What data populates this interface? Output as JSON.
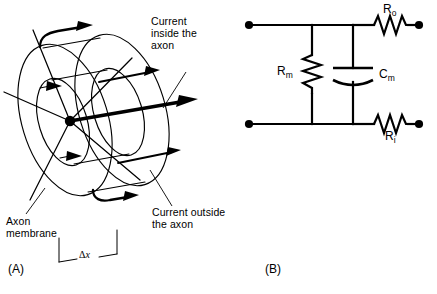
{
  "figure": {
    "background_color": "#ffffff",
    "stroke_color": "#000000",
    "width": 437,
    "height": 294
  },
  "panel_a": {
    "letter": "(A)",
    "description": "Cylindrical axon segment drawn as concentric ellipses with current arrows",
    "labels": {
      "current_inside": [
        "Current",
        "inside the",
        "axon"
      ],
      "current_outside": [
        "Current outside",
        "the axon"
      ],
      "axon_membrane": [
        "Axon",
        "membrane"
      ]
    },
    "dimension": {
      "delta": "Δ",
      "variable": "x"
    }
  },
  "panel_b": {
    "letter": "(B)",
    "description": "Equivalent electrical circuit of a membrane segment",
    "components": [
      {
        "id": "R_o",
        "symbol": "R",
        "subscript": "o",
        "type": "resistor",
        "position": "top-right"
      },
      {
        "id": "R_i",
        "symbol": "R",
        "subscript": "i",
        "type": "resistor",
        "position": "bottom-right"
      },
      {
        "id": "R_m",
        "symbol": "R",
        "subscript": "m",
        "type": "resistor",
        "position": "left-branch"
      },
      {
        "id": "C_m",
        "symbol": "C",
        "subscript": "m",
        "type": "capacitor",
        "position": "middle-branch"
      }
    ],
    "terminals": 4
  }
}
